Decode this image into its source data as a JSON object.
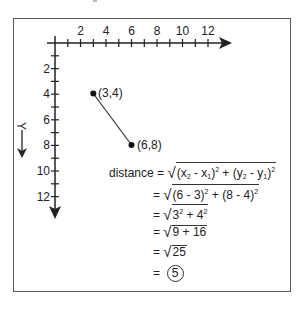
{
  "figure": {
    "x_axis": {
      "ticks": [
        "2",
        "4",
        "6",
        "8",
        "10",
        "12"
      ]
    },
    "y_axis": {
      "label": "Y",
      "ticks": [
        "2",
        "4",
        "6",
        "8",
        "10",
        "12"
      ]
    },
    "points": [
      {
        "label": "(3,4)",
        "x": 3,
        "y": 4
      },
      {
        "label": "(6,8)",
        "x": 6,
        "y": 8
      }
    ],
    "equation": {
      "lhs": "distance",
      "eq": "=",
      "line1": {
        "a": "(x",
        "a_sub": "2",
        "b": " - x",
        "b_sub": "1",
        "c": ")",
        "c_sup": "2",
        "d": " + (y",
        "d_sub": "2",
        "e": " - y",
        "e_sub": "1",
        "f": ")",
        "f_sup": "2"
      },
      "line2": {
        "a": "(6 - 3)",
        "a_sup": "2",
        "b": " + (8 - 4)",
        "b_sup": "2"
      },
      "line3": {
        "a": "3",
        "a_sup": "2",
        "b": " + 4",
        "b_sup": "2"
      },
      "line4": "9 + 16",
      "line5": "25",
      "result": "5"
    }
  }
}
